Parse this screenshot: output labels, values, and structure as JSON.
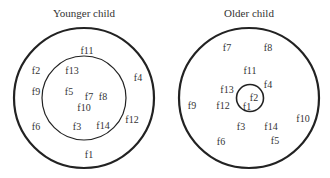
{
  "panels": [
    {
      "title": "Younger child",
      "labels": [
        {
          "text": "f11",
          "x": 87,
          "y": 54
        },
        {
          "text": "f2",
          "x": 36,
          "y": 74
        },
        {
          "text": "f13",
          "x": 72,
          "y": 74
        },
        {
          "text": "f4",
          "x": 138,
          "y": 81
        },
        {
          "text": "f9",
          "x": 36,
          "y": 95
        },
        {
          "text": "f5",
          "x": 69,
          "y": 95
        },
        {
          "text": "f7",
          "x": 89,
          "y": 100
        },
        {
          "text": "f8",
          "x": 103,
          "y": 100
        },
        {
          "text": "f10",
          "x": 84,
          "y": 111
        },
        {
          "text": "f12",
          "x": 132,
          "y": 123
        },
        {
          "text": "f6",
          "x": 36,
          "y": 130
        },
        {
          "text": "f3",
          "x": 77,
          "y": 130
        },
        {
          "text": "f14",
          "x": 103,
          "y": 129
        },
        {
          "text": "f1",
          "x": 89,
          "y": 158
        }
      ]
    },
    {
      "title": "Older child",
      "labels": [
        {
          "text": "f7",
          "x": 227,
          "y": 51
        },
        {
          "text": "f8",
          "x": 268,
          "y": 51
        },
        {
          "text": "f11",
          "x": 250,
          "y": 74
        },
        {
          "text": "f4",
          "x": 268,
          "y": 88
        },
        {
          "text": "f13",
          "x": 227,
          "y": 93
        },
        {
          "text": "f2",
          "x": 254,
          "y": 101
        },
        {
          "text": "f9",
          "x": 192,
          "y": 109
        },
        {
          "text": "f12",
          "x": 223,
          "y": 109
        },
        {
          "text": "f1",
          "x": 247,
          "y": 110
        },
        {
          "text": "f10",
          "x": 303,
          "y": 122
        },
        {
          "text": "f3",
          "x": 241,
          "y": 130
        },
        {
          "text": "f14",
          "x": 271,
          "y": 130
        },
        {
          "text": "f6",
          "x": 221,
          "y": 145
        },
        {
          "text": "f5",
          "x": 275,
          "y": 144
        }
      ]
    }
  ]
}
